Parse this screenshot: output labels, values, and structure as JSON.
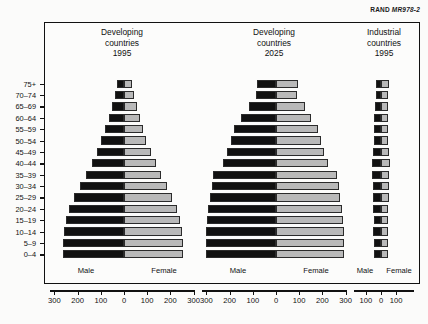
{
  "credit": {
    "brand": "RAND",
    "code": "MR978-2"
  },
  "axis": {
    "male_label": "Male",
    "female_label": "Female",
    "age_labels": [
      "75+",
      "70–74",
      "65–69",
      "60–64",
      "55–59",
      "50–54",
      "45–49",
      "40–44",
      "35–39",
      "30–34",
      "25–29",
      "20–24",
      "15–19",
      "10–14",
      "5–9",
      "0–4"
    ],
    "wide_ticks": [
      300,
      200,
      100,
      0,
      100,
      200,
      300
    ],
    "narrow_ticks": [
      100,
      0,
      100
    ]
  },
  "colors": {
    "male": "#111111",
    "female": "#b9b9b9",
    "frame": "#111111"
  },
  "chart_data": {
    "type": "bar",
    "xlabel": "Population (millions)",
    "ylabel": "Age group",
    "grid": false,
    "legend": [
      "Male",
      "Female"
    ],
    "legend_position": "bottom-inline",
    "categories": [
      "75+",
      "70–74",
      "65–69",
      "60–64",
      "55–59",
      "50–54",
      "45–49",
      "40–44",
      "35–39",
      "30–34",
      "25–29",
      "20–24",
      "15–19",
      "10–14",
      "5–9",
      "0–4"
    ],
    "panels": [
      {
        "title_lines": [
          "Developing",
          "countries",
          "1995"
        ],
        "region": "Developing countries",
        "year": "1995",
        "xlim": [
          -340,
          340
        ],
        "ticks": [
          300,
          200,
          100,
          0,
          100,
          200,
          300
        ],
        "series": [
          {
            "name": "Male",
            "values": [
              30,
              38,
              50,
              66,
              82,
              98,
              118,
              140,
              165,
              190,
              215,
              236,
              248,
              258,
              262,
              261
            ]
          },
          {
            "name": "Female",
            "values": [
              36,
              42,
              54,
              68,
              82,
              96,
              115,
              136,
              160,
              184,
              208,
              229,
              241,
              251,
              256,
              256
            ]
          }
        ]
      },
      {
        "title_lines": [
          "Developing",
          "countries",
          "2025"
        ],
        "region": "Developing countries",
        "year": "2025",
        "xlim": [
          -340,
          340
        ],
        "ticks": [
          300,
          200,
          100,
          0,
          100,
          200,
          300
        ],
        "series": [
          {
            "name": "Male",
            "values": [
              80,
              86,
              118,
              150,
              183,
              196,
              212,
              228,
              272,
              278,
              286,
              292,
              296,
              300,
              302,
              300
            ]
          },
          {
            "name": "Female",
            "values": [
              96,
              92,
              124,
              152,
              180,
              192,
              206,
              222,
              264,
              270,
              278,
              284,
              288,
              292,
              294,
              292
            ]
          }
        ]
      },
      {
        "title_lines": [
          "Industrial",
          "countries",
          "1995"
        ],
        "region": "Industrial countries",
        "year": "1995",
        "xlim": [
          -150,
          150
        ],
        "ticks": [
          100,
          0,
          100
        ],
        "series": [
          {
            "name": "Male",
            "values": [
              32,
              36,
              42,
              44,
              44,
              48,
              52,
              58,
              56,
              54,
              52,
              50,
              48,
              50,
              48,
              46
            ]
          },
          {
            "name": "Female",
            "values": [
              52,
              46,
              48,
              47,
              46,
              49,
              52,
              57,
              55,
              53,
              51,
              48,
              46,
              47,
              46,
              44
            ]
          }
        ]
      }
    ]
  }
}
